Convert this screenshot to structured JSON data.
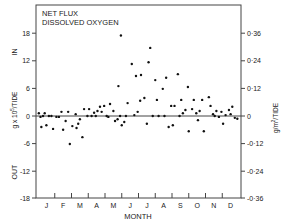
{
  "chart_data": {
    "type": "scatter",
    "title": "NET FLUX",
    "subtitle": "DISSOLVED OXYGEN",
    "xlabel": "MONTH",
    "ylabel_left": "g x 10^5 / TIDE",
    "ylabel_right": "g/m^2/TIDE",
    "direction_labels": {
      "top": "IN",
      "bottom": "OUT"
    },
    "x_ticks": [
      "J",
      "F",
      "M",
      "A",
      "M",
      "J",
      "J",
      "A",
      "S",
      "O",
      "N",
      "D"
    ],
    "y_left_ticks": [
      "18",
      "12",
      "6",
      "0",
      "-6",
      "-12",
      "-18"
    ],
    "y_left_values": [
      18,
      12,
      6,
      0,
      -6,
      -12,
      -18
    ],
    "y_right_ticks": [
      "0·36",
      "0·24",
      "0·12",
      "0",
      "-0·12",
      "-0·24",
      "-0·36"
    ],
    "ylim": [
      -18,
      18
    ],
    "xlim": [
      0,
      12
    ],
    "grid": false,
    "zero_line": true,
    "legend": null,
    "points": [
      {
        "x": 0.05,
        "y": 0.6
      },
      {
        "x": 0.15,
        "y": -0.2
      },
      {
        "x": 0.2,
        "y": -2.4
      },
      {
        "x": 0.3,
        "y": 0.0
      },
      {
        "x": 0.4,
        "y": 0.6
      },
      {
        "x": 0.5,
        "y": -2.0
      },
      {
        "x": 0.65,
        "y": 0.0
      },
      {
        "x": 0.8,
        "y": 0.0
      },
      {
        "x": 0.9,
        "y": -2.8
      },
      {
        "x": 1.1,
        "y": -0.2
      },
      {
        "x": 1.25,
        "y": -0.2
      },
      {
        "x": 1.4,
        "y": 0.9
      },
      {
        "x": 1.5,
        "y": -3.0
      },
      {
        "x": 1.65,
        "y": -1.1
      },
      {
        "x": 1.8,
        "y": 0.9
      },
      {
        "x": 1.9,
        "y": -6.1
      },
      {
        "x": 2.05,
        "y": -2.2
      },
      {
        "x": 2.25,
        "y": 0.4
      },
      {
        "x": 2.3,
        "y": -2.6
      },
      {
        "x": 2.4,
        "y": -1.7
      },
      {
        "x": 2.5,
        "y": -0.7
      },
      {
        "x": 2.65,
        "y": -4.6
      },
      {
        "x": 2.75,
        "y": 1.5
      },
      {
        "x": 2.95,
        "y": 0.0
      },
      {
        "x": 3.05,
        "y": 1.5
      },
      {
        "x": 3.2,
        "y": 0.0
      },
      {
        "x": 3.35,
        "y": 0.7
      },
      {
        "x": 3.45,
        "y": 0.0
      },
      {
        "x": 3.55,
        "y": 1.1
      },
      {
        "x": 3.7,
        "y": 2.0
      },
      {
        "x": 3.8,
        "y": 0.9
      },
      {
        "x": 3.95,
        "y": 2.2
      },
      {
        "x": 4.1,
        "y": 0.0
      },
      {
        "x": 4.2,
        "y": -0.2
      },
      {
        "x": 4.3,
        "y": 2.6
      },
      {
        "x": 4.5,
        "y": 1.1
      },
      {
        "x": 4.6,
        "y": -1.1
      },
      {
        "x": 4.75,
        "y": -0.7
      },
      {
        "x": 4.8,
        "y": 6.5
      },
      {
        "x": 4.9,
        "y": 0.0
      },
      {
        "x": 4.95,
        "y": 17.5
      },
      {
        "x": 5.0,
        "y": -2.0
      },
      {
        "x": 5.15,
        "y": -1.3
      },
      {
        "x": 5.25,
        "y": 0.0
      },
      {
        "x": 5.35,
        "y": 2.8
      },
      {
        "x": 5.6,
        "y": 11.3
      },
      {
        "x": 5.75,
        "y": 0.2
      },
      {
        "x": 5.85,
        "y": 8.7
      },
      {
        "x": 5.95,
        "y": 0.9
      },
      {
        "x": 6.1,
        "y": 3.3
      },
      {
        "x": 6.15,
        "y": 8.9
      },
      {
        "x": 6.35,
        "y": 3.9
      },
      {
        "x": 6.5,
        "y": -1.7
      },
      {
        "x": 6.6,
        "y": 11.7
      },
      {
        "x": 6.7,
        "y": 14.8
      },
      {
        "x": 6.85,
        "y": 0.0
      },
      {
        "x": 7.0,
        "y": 7.8
      },
      {
        "x": 7.1,
        "y": 3.5
      },
      {
        "x": 7.2,
        "y": 0.0
      },
      {
        "x": 7.45,
        "y": 5.9
      },
      {
        "x": 7.55,
        "y": 0.0
      },
      {
        "x": 7.65,
        "y": 8.3
      },
      {
        "x": 7.8,
        "y": -2.4
      },
      {
        "x": 7.95,
        "y": 2.2
      },
      {
        "x": 8.05,
        "y": -2.0
      },
      {
        "x": 8.15,
        "y": 2.2
      },
      {
        "x": 8.35,
        "y": 9.1
      },
      {
        "x": 8.45,
        "y": 0.0
      },
      {
        "x": 8.55,
        "y": 3.5
      },
      {
        "x": 8.65,
        "y": 0.6
      },
      {
        "x": 8.8,
        "y": 1.3
      },
      {
        "x": 8.95,
        "y": 6.3
      },
      {
        "x": 9.0,
        "y": -3.3
      },
      {
        "x": 9.2,
        "y": 1.5
      },
      {
        "x": 9.3,
        "y": 3.5
      },
      {
        "x": 9.45,
        "y": 0.6
      },
      {
        "x": 9.55,
        "y": -0.9
      },
      {
        "x": 9.65,
        "y": 1.1
      },
      {
        "x": 9.8,
        "y": 3.5
      },
      {
        "x": 9.9,
        "y": -3.3
      },
      {
        "x": 10.2,
        "y": 4.1
      },
      {
        "x": 10.3,
        "y": 2.2
      },
      {
        "x": 10.45,
        "y": 0.4
      },
      {
        "x": 10.55,
        "y": 0.0
      },
      {
        "x": 10.65,
        "y": 1.1
      },
      {
        "x": 10.8,
        "y": -0.2
      },
      {
        "x": 10.95,
        "y": 0.9
      },
      {
        "x": 11.05,
        "y": -1.7
      },
      {
        "x": 11.2,
        "y": 0.2
      },
      {
        "x": 11.4,
        "y": 1.3
      },
      {
        "x": 11.5,
        "y": 0.4
      },
      {
        "x": 11.6,
        "y": 2.0
      },
      {
        "x": 11.75,
        "y": -0.4
      },
      {
        "x": 11.9,
        "y": -0.6
      }
    ]
  }
}
